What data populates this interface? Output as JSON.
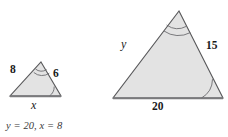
{
  "figure": {
    "type": "similar-triangles-diagram",
    "fill_color": "#e3e3e3",
    "stroke_color": "#58585a",
    "base_stroke_color": "#7a7a7c",
    "small_triangle": {
      "name": "small-triangle",
      "left_side_label": "8",
      "right_side_label": "6",
      "base_label": "x",
      "apex_arc_marks": 2,
      "base_right_arc_marks": 1,
      "vertices": {
        "apex": [
          41,
          62
        ],
        "bottom_left": [
          10,
          96
        ],
        "bottom_right": [
          61,
          96
        ]
      }
    },
    "large_triangle": {
      "name": "large-triangle",
      "left_side_label": "y",
      "right_side_label": "15",
      "base_label": "20",
      "apex_arc_marks": 2,
      "base_right_arc_marks": 1,
      "vertices": {
        "apex": [
          179,
          11
        ],
        "bottom_left": [
          113,
          98
        ],
        "bottom_right": [
          223,
          98
        ]
      }
    }
  },
  "answer": {
    "text": "y = 20, x = 8"
  }
}
